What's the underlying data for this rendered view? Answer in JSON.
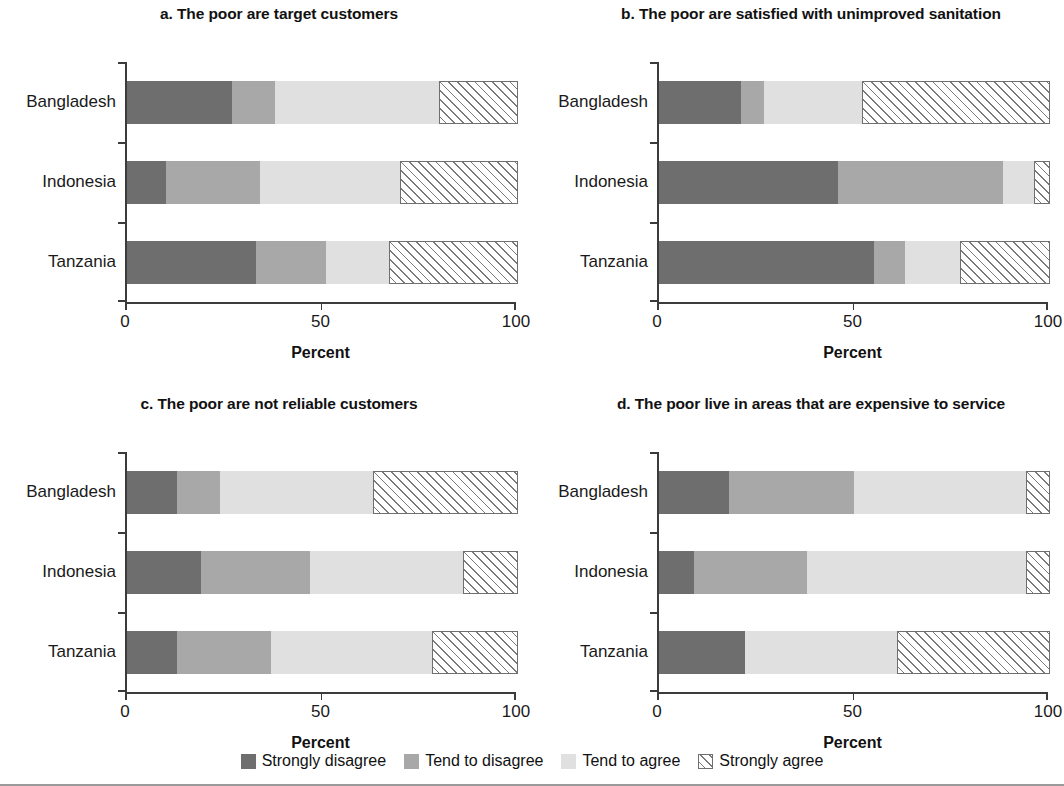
{
  "figure": {
    "axis_title": "Percent",
    "xticks": [
      "0",
      "50",
      "100"
    ],
    "xtick_values": [
      0,
      50,
      100
    ],
    "categories": [
      "Bangladesh",
      "Indonesia",
      "Tanzania"
    ],
    "colors": {
      "strongly_disagree": "#6e6e6e",
      "tend_to_disagree": "#a8a8a8",
      "tend_to_agree": "#e0e0e0",
      "strongly_agree": "#ffffff"
    }
  },
  "legend": {
    "items": [
      {
        "label": "Strongly disagree",
        "key": "strongly_disagree"
      },
      {
        "label": "Tend to disagree",
        "key": "tend_to_disagree"
      },
      {
        "label": "Tend to agree",
        "key": "tend_to_agree"
      },
      {
        "label": "Strongly agree",
        "key": "strongly_agree"
      }
    ]
  },
  "panels": [
    {
      "id": "a",
      "title": "a.  The poor are target customers"
    },
    {
      "id": "b",
      "title": "b. The poor are satisfied with unimproved sanitation"
    },
    {
      "id": "c",
      "title": "c. The poor are not reliable customers"
    },
    {
      "id": "d",
      "title": "d. The poor live in areas that are expensive to service"
    }
  ],
  "chart_data": [
    {
      "type": "bar",
      "orientation": "horizontal",
      "stacked": true,
      "stacked_mode": "percent",
      "panel": "a",
      "title": "a.  The poor are target customers",
      "xlabel": "Percent",
      "ylabel": "",
      "xlim": [
        0,
        100
      ],
      "xticks": [
        0,
        50,
        100
      ],
      "grid": false,
      "legend_position": "bottom",
      "categories": [
        "Bangladesh",
        "Indonesia",
        "Tanzania"
      ],
      "series": [
        {
          "name": "Strongly disagree",
          "values": [
            27,
            10,
            33
          ]
        },
        {
          "name": "Tend to disagree",
          "values": [
            11,
            24,
            18
          ]
        },
        {
          "name": "Tend to agree",
          "values": [
            42,
            36,
            16
          ]
        },
        {
          "name": "Strongly agree",
          "values": [
            20,
            30,
            33
          ]
        }
      ]
    },
    {
      "type": "bar",
      "orientation": "horizontal",
      "stacked": true,
      "stacked_mode": "percent",
      "panel": "b",
      "title": "b. The poor are satisfied with unimproved sanitation",
      "xlabel": "Percent",
      "ylabel": "",
      "xlim": [
        0,
        100
      ],
      "xticks": [
        0,
        50,
        100
      ],
      "grid": false,
      "legend_position": "bottom",
      "categories": [
        "Bangladesh",
        "Indonesia",
        "Tanzania"
      ],
      "series": [
        {
          "name": "Strongly disagree",
          "values": [
            21,
            46,
            55
          ]
        },
        {
          "name": "Tend to disagree",
          "values": [
            6,
            42,
            8
          ]
        },
        {
          "name": "Tend to agree",
          "values": [
            25,
            8,
            14
          ]
        },
        {
          "name": "Strongly agree",
          "values": [
            48,
            4,
            23
          ]
        }
      ]
    },
    {
      "type": "bar",
      "orientation": "horizontal",
      "stacked": true,
      "stacked_mode": "percent",
      "panel": "c",
      "title": "c. The poor are not reliable customers",
      "xlabel": "Percent",
      "ylabel": "",
      "xlim": [
        0,
        100
      ],
      "xticks": [
        0,
        50,
        100
      ],
      "grid": false,
      "legend_position": "bottom",
      "categories": [
        "Bangladesh",
        "Indonesia",
        "Tanzania"
      ],
      "series": [
        {
          "name": "Strongly disagree",
          "values": [
            13,
            19,
            13
          ]
        },
        {
          "name": "Tend to disagree",
          "values": [
            11,
            28,
            24
          ]
        },
        {
          "name": "Tend to agree",
          "values": [
            39,
            39,
            41
          ]
        },
        {
          "name": "Strongly agree",
          "values": [
            37,
            14,
            22
          ]
        }
      ]
    },
    {
      "type": "bar",
      "orientation": "horizontal",
      "stacked": true,
      "stacked_mode": "percent",
      "panel": "d",
      "title": "d. The poor live in areas that are expensive to service",
      "xlabel": "Percent",
      "ylabel": "",
      "xlim": [
        0,
        100
      ],
      "xticks": [
        0,
        50,
        100
      ],
      "grid": false,
      "legend_position": "bottom",
      "categories": [
        "Bangladesh",
        "Indonesia",
        "Tanzania"
      ],
      "series": [
        {
          "name": "Strongly disagree",
          "values": [
            18,
            9,
            22
          ]
        },
        {
          "name": "Tend to disagree",
          "values": [
            32,
            29,
            0
          ]
        },
        {
          "name": "Tend to agree",
          "values": [
            44,
            56,
            39
          ]
        },
        {
          "name": "Strongly agree",
          "values": [
            6,
            6,
            39
          ]
        }
      ]
    }
  ]
}
